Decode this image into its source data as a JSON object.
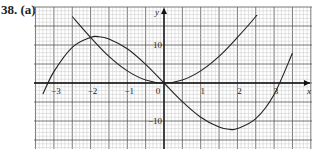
{
  "problem_label": "38. (a)",
  "chart_data": {
    "type": "line",
    "title": "",
    "xlabel": "x",
    "ylabel": "y",
    "x_ticks": [
      -3,
      -2,
      -1,
      0,
      1,
      2,
      3
    ],
    "y_ticks": [
      10,
      -10
    ],
    "xlim": [
      -3.5,
      4.1
    ],
    "ylim": [
      -17,
      20
    ],
    "grid": true,
    "series": [
      {
        "name": "cubic",
        "x": [
          -3.3,
          -3.0,
          -2.5,
          -2.0,
          -1.8,
          -1.5,
          -1.0,
          -0.5,
          0,
          0.5,
          1.0,
          1.5,
          1.8,
          2.0,
          2.5,
          3.0,
          3.5
        ],
        "values": [
          -2.9,
          3.0,
          9.4,
          12.0,
          12.2,
          11.6,
          9.0,
          4.9,
          0,
          -4.9,
          -9.0,
          -11.6,
          -12.2,
          -12.0,
          -9.4,
          -3.0,
          7.9
        ]
      },
      {
        "name": "parabola-like",
        "x": [
          -2.5,
          -2.0,
          -1.5,
          -1.0,
          -0.5,
          0,
          0.5,
          1.0,
          1.5,
          2.0,
          2.5,
          3.0
        ],
        "values": [
          17.5,
          12.0,
          7.0,
          3.2,
          0.8,
          0,
          0.8,
          3.2,
          7.0,
          12.0,
          17.5,
          24
        ]
      }
    ]
  }
}
